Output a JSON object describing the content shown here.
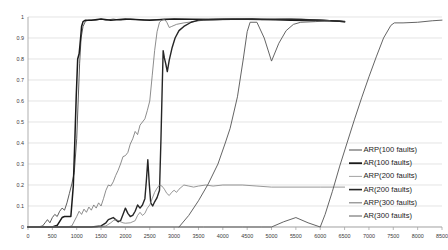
{
  "chart_data": {
    "type": "line",
    "title": "",
    "subtitle": "",
    "xlabel": "",
    "ylabel": "",
    "xlim": [
      0,
      8500
    ],
    "ylim": [
      0,
      1
    ],
    "grid": true,
    "grid_axis": "y",
    "legend_position": "right-inside-lower",
    "x_ticks": [
      0,
      500,
      1000,
      1500,
      2000,
      2500,
      3000,
      3500,
      4000,
      4500,
      5000,
      5500,
      6000,
      6500,
      7000,
      7500,
      8000,
      8500
    ],
    "x_tick_labels": [
      "0",
      "500",
      "1000",
      "1500",
      "2000",
      "2500",
      "3000",
      "3500",
      "4000",
      "4500",
      "5000",
      "5500",
      "6000",
      "6500",
      "7000",
      "7500",
      "8000",
      "8500"
    ],
    "y_ticks": [
      0,
      0.1,
      0.2,
      0.3,
      0.4,
      0.5,
      0.6,
      0.7,
      0.8,
      0.9,
      1
    ],
    "y_tick_labels": [
      "0",
      "0.1",
      "0.2",
      "0.3",
      "0.4",
      "0.5",
      "0.6",
      "0.7",
      "0.8",
      "0.9",
      "1"
    ],
    "series": [
      {
        "name": "ARP(100 faults)",
        "color": "#4a4a4a",
        "width": 0.9,
        "points": [
          [
            0,
            0.0
          ],
          [
            200,
            0.0
          ],
          [
            300,
            0.005
          ],
          [
            350,
            0.02
          ],
          [
            400,
            0.035
          ],
          [
            450,
            0.02
          ],
          [
            500,
            0.045
          ],
          [
            550,
            0.06
          ],
          [
            600,
            0.05
          ],
          [
            650,
            0.075
          ],
          [
            700,
            0.09
          ],
          [
            750,
            0.08
          ],
          [
            800,
            0.115
          ],
          [
            850,
            0.16
          ],
          [
            900,
            0.205
          ],
          [
            950,
            0.26
          ],
          [
            1000,
            0.42
          ],
          [
            1030,
            0.6
          ],
          [
            1060,
            0.78
          ],
          [
            1090,
            0.9
          ],
          [
            1130,
            0.955
          ],
          [
            1180,
            0.98
          ],
          [
            1250,
            0.985
          ],
          [
            1400,
            0.985
          ],
          [
            1500,
            0.99
          ],
          [
            1600,
            0.985
          ],
          [
            1750,
            0.99
          ],
          [
            1900,
            0.985
          ],
          [
            2100,
            0.99
          ],
          [
            2400,
            0.985
          ],
          [
            2800,
            0.99
          ],
          [
            3400,
            0.988
          ],
          [
            4000,
            0.99
          ],
          [
            4800,
            0.988
          ],
          [
            5600,
            0.99
          ],
          [
            6300,
            0.982
          ],
          [
            6500,
            0.978
          ]
        ]
      },
      {
        "name": "AR(100 faults)",
        "color": "#1a1a1a",
        "width": 1.5,
        "points": [
          [
            0,
            0.0
          ],
          [
            400,
            0.0
          ],
          [
            500,
            0.0
          ],
          [
            600,
            0.008
          ],
          [
            700,
            0.045
          ],
          [
            750,
            0.05
          ],
          [
            820,
            0.05
          ],
          [
            880,
            0.05
          ],
          [
            930,
            0.195
          ],
          [
            960,
            0.4
          ],
          [
            990,
            0.62
          ],
          [
            1020,
            0.8
          ],
          [
            1050,
            0.825
          ],
          [
            1080,
            0.9
          ],
          [
            1100,
            0.955
          ],
          [
            1130,
            0.978
          ],
          [
            1180,
            0.985
          ],
          [
            1300,
            0.985
          ],
          [
            1500,
            0.99
          ],
          [
            1700,
            0.985
          ],
          [
            2000,
            0.99
          ],
          [
            2500,
            0.985
          ],
          [
            3000,
            0.99
          ],
          [
            3800,
            0.988
          ],
          [
            4600,
            0.99
          ],
          [
            5400,
            0.985
          ],
          [
            6200,
            0.982
          ],
          [
            6500,
            0.978
          ]
        ]
      },
      {
        "name": "ARP(200 faults)",
        "color": "#707070",
        "width": 0.8,
        "points": [
          [
            0,
            0.0
          ],
          [
            800,
            0.0
          ],
          [
            900,
            0.005
          ],
          [
            1000,
            0.05
          ],
          [
            1050,
            0.075
          ],
          [
            1100,
            0.06
          ],
          [
            1150,
            0.085
          ],
          [
            1200,
            0.07
          ],
          [
            1250,
            0.095
          ],
          [
            1300,
            0.08
          ],
          [
            1350,
            0.105
          ],
          [
            1400,
            0.09
          ],
          [
            1450,
            0.115
          ],
          [
            1500,
            0.1
          ],
          [
            1550,
            0.135
          ],
          [
            1600,
            0.175
          ],
          [
            1650,
            0.2
          ],
          [
            1700,
            0.195
          ],
          [
            1750,
            0.215
          ],
          [
            1800,
            0.245
          ],
          [
            1850,
            0.27
          ],
          [
            1900,
            0.3
          ],
          [
            1950,
            0.335
          ],
          [
            2000,
            0.34
          ],
          [
            2050,
            0.355
          ],
          [
            2100,
            0.395
          ],
          [
            2150,
            0.42
          ],
          [
            2200,
            0.455
          ],
          [
            2250,
            0.44
          ],
          [
            2300,
            0.485
          ],
          [
            2350,
            0.5
          ],
          [
            2400,
            0.515
          ],
          [
            2450,
            0.555
          ],
          [
            2500,
            0.6
          ],
          [
            2550,
            0.72
          ],
          [
            2600,
            0.84
          ],
          [
            2650,
            0.93
          ],
          [
            2700,
            0.975
          ],
          [
            2750,
            0.985
          ],
          [
            2800,
            0.99
          ],
          [
            2850,
            0.975
          ],
          [
            2900,
            0.95
          ],
          [
            2950,
            0.955
          ],
          [
            3050,
            0.965
          ],
          [
            3200,
            0.972
          ],
          [
            3400,
            0.978
          ],
          [
            3600,
            0.985
          ],
          [
            4000,
            0.988
          ],
          [
            4600,
            0.988
          ],
          [
            5200,
            0.99
          ],
          [
            6000,
            0.985
          ],
          [
            6400,
            0.98
          ],
          [
            6500,
            0.978
          ]
        ]
      },
      {
        "name": "AR(200 faults)",
        "color": "#262626",
        "width": 1.4,
        "points": [
          [
            0,
            0.0
          ],
          [
            1000,
            0.0
          ],
          [
            1300,
            0.0
          ],
          [
            1500,
            0.005
          ],
          [
            1600,
            0.02
          ],
          [
            1650,
            0.035
          ],
          [
            1700,
            0.04
          ],
          [
            1750,
            0.045
          ],
          [
            1800,
            0.035
          ],
          [
            1850,
            0.025
          ],
          [
            1900,
            0.03
          ],
          [
            1950,
            0.06
          ],
          [
            2000,
            0.09
          ],
          [
            2050,
            0.065
          ],
          [
            2100,
            0.05
          ],
          [
            2150,
            0.055
          ],
          [
            2200,
            0.075
          ],
          [
            2250,
            0.105
          ],
          [
            2300,
            0.09
          ],
          [
            2350,
            0.105
          ],
          [
            2400,
            0.135
          ],
          [
            2430,
            0.22
          ],
          [
            2460,
            0.32
          ],
          [
            2490,
            0.205
          ],
          [
            2520,
            0.115
          ],
          [
            2560,
            0.1
          ],
          [
            2600,
            0.12
          ],
          [
            2650,
            0.14
          ],
          [
            2700,
            0.175
          ],
          [
            2730,
            0.42
          ],
          [
            2755,
            0.66
          ],
          [
            2775,
            0.84
          ],
          [
            2800,
            0.805
          ],
          [
            2830,
            0.775
          ],
          [
            2860,
            0.74
          ],
          [
            2900,
            0.795
          ],
          [
            2960,
            0.855
          ],
          [
            3020,
            0.9
          ],
          [
            3100,
            0.935
          ],
          [
            3200,
            0.955
          ],
          [
            3350,
            0.975
          ],
          [
            3500,
            0.985
          ],
          [
            3800,
            0.988
          ],
          [
            4200,
            0.99
          ],
          [
            4800,
            0.988
          ],
          [
            5400,
            0.99
          ],
          [
            6000,
            0.985
          ],
          [
            6400,
            0.98
          ],
          [
            6500,
            0.977
          ]
        ]
      },
      {
        "name": "ARP(300 faults)",
        "color": "#7d7d7d",
        "width": 0.8,
        "points": [
          [
            0,
            0.0
          ],
          [
            1400,
            0.0
          ],
          [
            1600,
            0.005
          ],
          [
            1700,
            0.02
          ],
          [
            1750,
            0.03
          ],
          [
            1800,
            0.035
          ],
          [
            1850,
            0.032
          ],
          [
            1900,
            0.025
          ],
          [
            1950,
            0.02
          ],
          [
            2000,
            0.018
          ],
          [
            2100,
            0.02
          ],
          [
            2200,
            0.03
          ],
          [
            2250,
            0.055
          ],
          [
            2300,
            0.07
          ],
          [
            2350,
            0.055
          ],
          [
            2400,
            0.065
          ],
          [
            2450,
            0.09
          ],
          [
            2500,
            0.105
          ],
          [
            2550,
            0.135
          ],
          [
            2600,
            0.165
          ],
          [
            2650,
            0.185
          ],
          [
            2700,
            0.2
          ],
          [
            2750,
            0.195
          ],
          [
            2800,
            0.18
          ],
          [
            2850,
            0.16
          ],
          [
            2900,
            0.15
          ],
          [
            2950,
            0.165
          ],
          [
            3000,
            0.175
          ],
          [
            3050,
            0.165
          ],
          [
            3100,
            0.18
          ],
          [
            3200,
            0.2
          ],
          [
            3300,
            0.195
          ],
          [
            3400,
            0.19
          ],
          [
            3500,
            0.195
          ],
          [
            3650,
            0.2
          ],
          [
            3800,
            0.195
          ],
          [
            4000,
            0.2
          ],
          [
            4400,
            0.2
          ],
          [
            4700,
            0.195
          ],
          [
            5000,
            0.19
          ],
          [
            5400,
            0.19
          ],
          [
            6000,
            0.19
          ],
          [
            6500,
            0.19
          ]
        ]
      },
      {
        "name": "AR(300 faults)",
        "color": "#5c5c5c",
        "width": 0.95,
        "points": [
          [
            0,
            0.0
          ],
          [
            2000,
            0.0
          ],
          [
            3000,
            0.0
          ],
          [
            3600,
            0.0
          ],
          [
            4000,
            0.0
          ],
          [
            4400,
            0.0
          ],
          [
            4800,
            0.0
          ],
          [
            5000,
            0.0
          ],
          [
            5250,
            0.025
          ],
          [
            5500,
            0.045
          ],
          [
            5750,
            0.02
          ],
          [
            6000,
            0.0
          ],
          [
            6100,
            0.06
          ],
          [
            6250,
            0.17
          ],
          [
            6400,
            0.29
          ],
          [
            6550,
            0.4
          ],
          [
            6700,
            0.51
          ],
          [
            6850,
            0.615
          ],
          [
            7000,
            0.715
          ],
          [
            7150,
            0.81
          ],
          [
            7300,
            0.9
          ],
          [
            7450,
            0.96
          ],
          [
            7520,
            0.972
          ],
          [
            7700,
            0.972
          ],
          [
            8000,
            0.975
          ],
          [
            8300,
            0.982
          ],
          [
            8500,
            0.985
          ]
        ]
      }
    ],
    "plateau_markers": [
      {
        "name": "ar300-peak-4500",
        "x": 4500,
        "y": 0.985
      },
      {
        "name": "ar300-dip-5000",
        "x": 5000,
        "y": 0.79
      },
      {
        "name": "ar300-peak-5600",
        "x": 5600,
        "y": 0.975
      }
    ]
  },
  "overlay_curves": [
    {
      "name": "ar300-upper-branch",
      "color": "#5c5c5c",
      "width": 0.95,
      "points": [
        [
          3100,
          0.0
        ],
        [
          3300,
          0.055
        ],
        [
          3500,
          0.125
        ],
        [
          3700,
          0.205
        ],
        [
          3900,
          0.3
        ],
        [
          4050,
          0.4
        ],
        [
          4150,
          0.47
        ],
        [
          4300,
          0.62
        ],
        [
          4420,
          0.8
        ],
        [
          4500,
          0.93
        ],
        [
          4560,
          0.975
        ],
        [
          4700,
          0.975
        ],
        [
          4850,
          0.9
        ],
        [
          5000,
          0.79
        ],
        [
          5150,
          0.875
        ],
        [
          5300,
          0.935
        ],
        [
          5450,
          0.965
        ],
        [
          5600,
          0.975
        ],
        [
          5900,
          0.978
        ],
        [
          6200,
          0.982
        ]
      ]
    }
  ],
  "legend": {
    "entries": [
      {
        "label": "ARP(100 faults)",
        "color": "#4a4a4a",
        "width": 1.0
      },
      {
        "label": "AR(100 faults)",
        "color": "#1a1a1a",
        "width": 1.8
      },
      {
        "label": "ARP(200 faults)",
        "color": "#8a8a8a",
        "width": 0.8
      },
      {
        "label": "AR(200 faults)",
        "color": "#262626",
        "width": 1.6
      },
      {
        "label": "ARP(300 faults)",
        "color": "#7d7d7d",
        "width": 1.1
      },
      {
        "label": "AR(300 faults)",
        "color": "#5c5c5c",
        "width": 1.0
      }
    ]
  },
  "style": {
    "grid_color": "#d9d9d9",
    "axis_color": "#a6a6a6",
    "background": "#ffffff"
  }
}
